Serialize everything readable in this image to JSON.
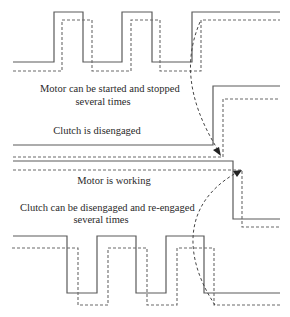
{
  "labels": {
    "motor_start_stop_line1": "Motor can be started and stopped",
    "motor_start_stop_line2": "several times",
    "clutch_disengaged": "Clutch is disengaged",
    "motor_working": "Motor is working",
    "clutch_reengage_line1": "Clutch can be disengaged and re-engaged",
    "clutch_reengage_line2": "several times"
  },
  "legend_styles": {
    "solid_line": "solid",
    "dashed_line": "dashed"
  },
  "colors": {
    "line": "#5a5a5a",
    "arrow": "#222222",
    "text": "#2a2a2a",
    "background": "#ffffff"
  }
}
